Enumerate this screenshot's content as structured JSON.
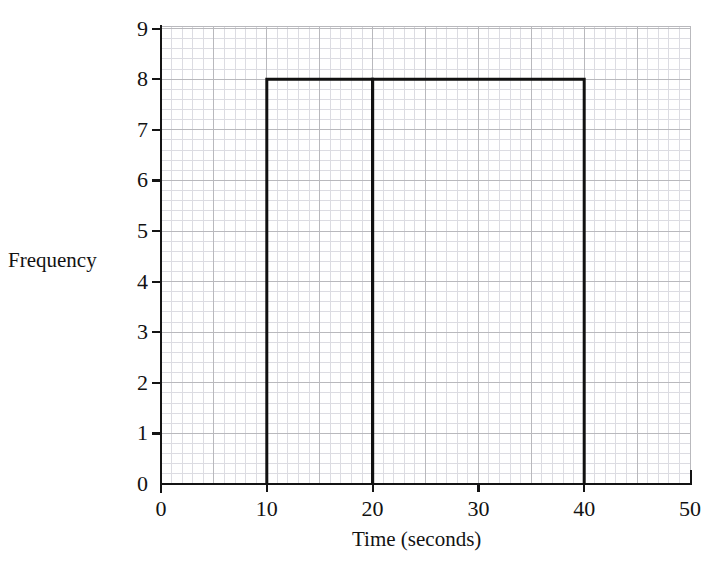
{
  "chart_data": {
    "type": "bar",
    "title": "",
    "subtitle": "",
    "xlabel": "Time (seconds)",
    "ylabel": "Frequency",
    "xlim": [
      0,
      50
    ],
    "ylim": [
      0,
      9
    ],
    "xticks": [
      0,
      10,
      20,
      30,
      40,
      50
    ],
    "yticks": [
      0,
      1,
      2,
      3,
      4,
      5,
      6,
      7,
      8,
      9
    ],
    "xtick_labels": [
      "0",
      "10",
      "20",
      "30",
      "40",
      "50"
    ],
    "ytick_labels": [
      "0",
      "1",
      "2",
      "3",
      "4",
      "5",
      "6",
      "7",
      "8",
      "9"
    ],
    "grid": true,
    "grid_minor": true,
    "grid_minor_step_x": 1,
    "grid_minor_step_y": 0.2,
    "grid_major_step_x": 5,
    "grid_major_step_y": 1,
    "legend": null,
    "legend_position": "none",
    "bars": [
      {
        "label": "10-20",
        "x_start": 10,
        "x_end": 20,
        "frequency": 8
      },
      {
        "label": "20-40",
        "x_start": 20,
        "x_end": 40,
        "frequency": 8
      }
    ],
    "categories": [
      "10-20",
      "20-40"
    ],
    "values": [
      8,
      8
    ],
    "annotations": []
  },
  "style": {
    "bar_outline_color": "#111111",
    "bar_fill_color": "none",
    "axis_color": "#141414",
    "grid_major_color": "#b9b9bd",
    "grid_minor_color": "#dcdce2",
    "background_color": "#ffffff",
    "text_color": "#121212"
  },
  "geometry": {
    "origin_x": 161,
    "origin_y": 484,
    "plot_right": 690,
    "plot_top": 26,
    "px_per_x_unit": 10.58,
    "px_per_y_unit": 50.6
  }
}
